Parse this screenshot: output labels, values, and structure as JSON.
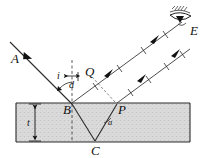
{
  "figure": {
    "type": "optics-ray-diagram",
    "width": 205,
    "height": 158,
    "background": "#ffffff"
  },
  "colors": {
    "ink": "#111111",
    "ray": "#333333",
    "slab_fill": "#d8d8d8",
    "slab_edge": "#2b2b2b",
    "dashed": "#222222"
  },
  "labels": {
    "incident_ray": "A",
    "point_B": "B",
    "point_P": "P",
    "point_C": "C",
    "point_Q": "Q",
    "eye": "E",
    "angle_incidence": "i",
    "lateral_shift": "d",
    "thickness": "t",
    "angle_refraction": "a"
  },
  "elements": {
    "slab": {
      "name": "glass-slab",
      "x": 16,
      "y": 103,
      "width": 174,
      "height": 39
    },
    "rays": [
      {
        "name": "incident-ray-AB",
        "from": "A",
        "to": "B",
        "arrow": true
      },
      {
        "name": "reflected-ray-B-to-eye",
        "from": "B",
        "to": "E",
        "ticks": 4,
        "arrows": 2
      },
      {
        "name": "refracted-ray-BC",
        "from": "B",
        "to": "C"
      },
      {
        "name": "refracted-ray-CP",
        "from": "C",
        "to": "P"
      },
      {
        "name": "emergent-ray-P-to-eye",
        "from": "P",
        "to": "E",
        "ticks": 4,
        "arrows": 2
      },
      {
        "name": "virtual-ray-P-to-Q",
        "from": "P",
        "to": "Q",
        "dashed": true
      }
    ],
    "normals": [
      {
        "name": "normal-at-B",
        "dashed": true
      },
      {
        "name": "normal-at-P",
        "dashed": true
      },
      {
        "name": "normal-through-C",
        "dashed": true
      }
    ],
    "markers": [
      {
        "name": "angle-arc-i",
        "label": "i"
      },
      {
        "name": "lateral-shift-marker-d",
        "label": "d"
      },
      {
        "name": "thickness-dimension-t",
        "label": "t"
      },
      {
        "name": "angle-arc-a",
        "label": "a"
      }
    ],
    "eye_symbol": {
      "name": "eye-icon",
      "x": 170,
      "y": 10
    }
  }
}
